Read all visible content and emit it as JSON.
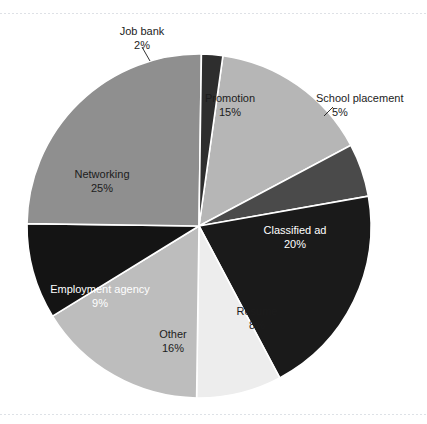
{
  "figure": {
    "background_color": "#ffffff",
    "rule_color": "#d8dce2"
  },
  "chart_data": {
    "type": "pie",
    "title": "",
    "subtitle": "",
    "xlabel": "",
    "ylabel": "",
    "legend_position": "none",
    "grid": false,
    "total": 100,
    "value_unit": "%",
    "start_angle_deg": 8,
    "direction": "clockwise",
    "categories": [
      "Promotion",
      "School placement",
      "Classified ad",
      "Resume",
      "Other",
      "Employment agency",
      "Networking",
      "Job bank"
    ],
    "values": [
      15,
      5,
      20,
      8,
      16,
      9,
      25,
      2
    ],
    "slices": [
      {
        "label": "Promotion",
        "value": 15,
        "value_text": "15%",
        "color": "#b6b6b6",
        "label_placement": "inside",
        "text_color": "#1c1c1c"
      },
      {
        "label": "School placement",
        "value": 5,
        "value_text": "5%",
        "color": "#4a4a4a",
        "label_placement": "outside",
        "text_color": "#1c1c1c"
      },
      {
        "label": "Classified ad",
        "value": 20,
        "value_text": "20%",
        "color": "#1a1a1a",
        "label_placement": "inside",
        "text_color": "#ffffff"
      },
      {
        "label": "Resume",
        "value": 8,
        "value_text": "8%",
        "color": "#ededed",
        "label_placement": "inside",
        "text_color": "#1c1c1c"
      },
      {
        "label": "Other",
        "value": 16,
        "value_text": "16%",
        "color": "#bdbdbd",
        "label_placement": "inside",
        "text_color": "#1c1c1c"
      },
      {
        "label": "Employment agency",
        "value": 9,
        "value_text": "9%",
        "color": "#141414",
        "label_placement": "inside",
        "text_color": "#ffffff"
      },
      {
        "label": "Networking",
        "value": 25,
        "value_text": "25%",
        "color": "#8f8f8f",
        "label_placement": "inside",
        "text_color": "#1c1c1c"
      },
      {
        "label": "Job bank",
        "value": 2,
        "value_text": "2%",
        "color": "#2e2e2e",
        "label_placement": "outside",
        "text_color": "#1c1c1c"
      }
    ]
  },
  "labels": {
    "job_bank_name": "Job bank",
    "job_bank_value": "2%",
    "promotion_name": "Promotion",
    "promotion_value": "15%",
    "school_placement_name": "School placement",
    "school_placement_value": "5%",
    "classified_ad_name": "Classified ad",
    "classified_ad_value": "20%",
    "resume_name": "Resume",
    "resume_value": "8%",
    "other_name": "Other",
    "other_value": "16%",
    "employment_agency_name": "Employment agency",
    "employment_agency_value": "9%",
    "networking_name": "Networking",
    "networking_value": "25%"
  }
}
